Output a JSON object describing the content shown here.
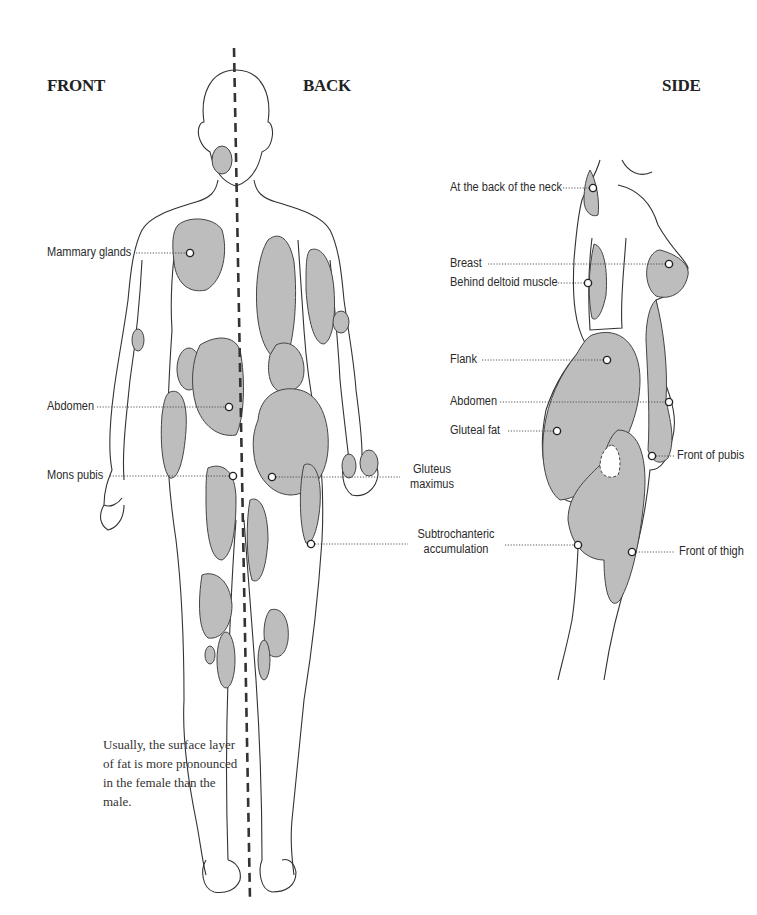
{
  "headings": {
    "front": "FRONT",
    "back": "BACK",
    "side": "SIDE"
  },
  "labels": {
    "front": [
      {
        "id": "mammary-glands",
        "text": "Mammary glands"
      },
      {
        "id": "abdomen",
        "text": "Abdomen"
      },
      {
        "id": "mons-pubis",
        "text": "Mons pubis"
      }
    ],
    "back": [
      {
        "id": "gluteus-maximus",
        "line1": "Gluteus",
        "line2": "maximus"
      },
      {
        "id": "subtrochanteric",
        "line1": "Subtrochanteric",
        "line2": "accumulation"
      }
    ],
    "side": [
      {
        "id": "back-of-neck",
        "text": "At the back of the neck"
      },
      {
        "id": "breast",
        "text": "Breast"
      },
      {
        "id": "behind-deltoid",
        "text": "Behind deltoid muscle"
      },
      {
        "id": "flank",
        "text": "Flank"
      },
      {
        "id": "side-abdomen",
        "text": "Abdomen"
      },
      {
        "id": "gluteal-fat",
        "text": "Gluteal fat"
      },
      {
        "id": "front-of-pubis",
        "text": "Front of pubis"
      },
      {
        "id": "front-of-thigh",
        "text": "Front of thigh"
      }
    ]
  },
  "caption": "Usually, the surface layer of fat is more pronounced in the female than the male.",
  "colors": {
    "fat_fill": "#b9b9b9",
    "outline": "#333333",
    "divider": "#333333"
  }
}
